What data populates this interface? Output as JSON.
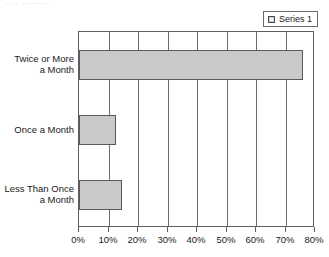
{
  "top_cropped_text": "····  ·········",
  "legend": {
    "position": "top-right",
    "swatch_name": "series-1-swatch",
    "entries": [
      {
        "label": "Series 1",
        "color": "#c9c9c9"
      }
    ]
  },
  "colors": {
    "bar_fill": "#c9c9c9",
    "bar_border": "#5a5a5a",
    "gridline": "#6e6e6e",
    "axis": "#5f5f5f",
    "text": "#1a1a1a",
    "background": "#ffffff"
  },
  "chart_data": {
    "type": "bar",
    "orientation": "horizontal",
    "title": "",
    "subtitle": "",
    "xlabel": "",
    "ylabel": "",
    "categories": [
      "Twice or More\na Month",
      "Once a Month",
      "Less Than Once\na Month"
    ],
    "series": [
      {
        "name": "Series 1",
        "values": [
          76,
          12.5,
          14.5
        ]
      }
    ],
    "values": [
      76,
      12.5,
      14.5
    ],
    "xlim": [
      0,
      80
    ],
    "ylim": [
      0,
      3
    ],
    "xticks": [
      0,
      10,
      20,
      30,
      40,
      50,
      60,
      70,
      80
    ],
    "xticklabels": [
      "0%",
      "10%",
      "20%",
      "30%",
      "40%",
      "50%",
      "60%",
      "70%",
      "80%"
    ],
    "value_format": "percent",
    "grid": {
      "vertical": true,
      "horizontal": false
    },
    "legend_position": "top-right",
    "data_labels": false
  }
}
